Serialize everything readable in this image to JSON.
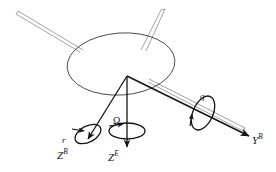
{
  "figure": {
    "kind": "free-body-axis-diagram",
    "background_color": "#ffffff",
    "line_color_dark": "#141414",
    "line_color_light": "#8a8a8a"
  },
  "labels": {
    "z_body": {
      "symbol": "Z",
      "superscript": "B",
      "name": "body-frame vertical axis"
    },
    "z_earth": {
      "symbol": "Z",
      "superscript": "E",
      "name": "earth-frame vertical axis"
    },
    "y_body": {
      "symbol": "Y",
      "superscript": "B",
      "name": "body-frame lateral axis"
    },
    "rate_r": {
      "symbol": "r",
      "name": "yaw rate about body Z axis"
    },
    "rate_q": {
      "symbol": "q",
      "name": "pitch rate about body Y axis"
    },
    "rate_omega": {
      "symbol": "Ω",
      "name": "rotor angular velocity about earth Z axis"
    }
  },
  "elements": {
    "body": "fuselage-ellipse",
    "arm_upper_left": "boom-tube-upper-left",
    "arm_upper_right": "boom-tube-upper-right",
    "arm_lower_right": "boom-tube-lower-right",
    "vector_z_body": "arrow-down-left",
    "vector_z_earth": "arrow-straight-down",
    "vector_y_body": "arrow-down-right",
    "spin_r": "curved-rotation-arrow-left",
    "spin_omega": "curved-rotation-arrow-center",
    "spin_q": "curved-rotation-arrow-right"
  }
}
